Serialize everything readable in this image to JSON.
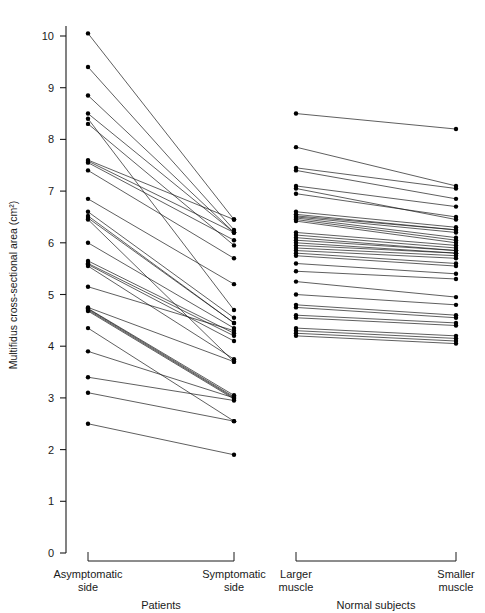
{
  "figure": {
    "background_color": "#ffffff",
    "ink_color": "#1a1a1a"
  },
  "chart_data": {
    "type": "line",
    "subtype": "paired-slope-chart",
    "title": "",
    "subtitle": "",
    "xlabel": "",
    "ylabel": "Multifidus cross-sectional area (cm²)",
    "ylim": [
      0,
      10.5
    ],
    "yticks": [
      0,
      1,
      2,
      3,
      4,
      5,
      6,
      7,
      8,
      9,
      10
    ],
    "ytick_labels": [
      "0",
      "1",
      "2",
      "3",
      "4",
      "5",
      "6",
      "7",
      "8",
      "9",
      "10"
    ],
    "grid": false,
    "legend": "none",
    "x_categories": [
      "Asymptomatic side",
      "Symptomatic side",
      "Larger muscle",
      "Smaller muscle"
    ],
    "groups": [
      {
        "name": "Patients",
        "left_label_line1": "Asymptomatic",
        "left_label_line2": "side",
        "right_label_line1": "Symptomatic",
        "right_label_line2": "side",
        "n": 28,
        "pairs": [
          [
            10.05,
            6.45
          ],
          [
            9.4,
            6.25
          ],
          [
            8.85,
            6.2
          ],
          [
            8.5,
            6.2
          ],
          [
            8.4,
            4.7
          ],
          [
            8.3,
            5.95
          ],
          [
            7.6,
            6.45
          ],
          [
            7.58,
            6.2
          ],
          [
            7.55,
            6.05
          ],
          [
            7.4,
            5.7
          ],
          [
            6.85,
            5.2
          ],
          [
            6.6,
            4.55
          ],
          [
            6.52,
            4.45
          ],
          [
            6.48,
            4.45
          ],
          [
            6.45,
            3.7
          ],
          [
            6.0,
            4.35
          ],
          [
            5.65,
            4.25
          ],
          [
            5.6,
            4.2
          ],
          [
            5.58,
            4.1
          ],
          [
            5.55,
            3.75
          ],
          [
            5.15,
            4.3
          ],
          [
            4.75,
            3.7
          ],
          [
            4.73,
            3.05
          ],
          [
            4.72,
            3.02
          ],
          [
            4.7,
            3.0
          ],
          [
            4.68,
            2.98
          ],
          [
            4.35,
            2.55
          ],
          [
            3.9,
            3.0
          ],
          [
            3.4,
            2.95
          ],
          [
            3.1,
            2.55
          ],
          [
            2.5,
            1.9
          ]
        ]
      },
      {
        "name": "Normal subjects",
        "left_label_line1": "Larger",
        "left_label_line2": "muscle",
        "right_label_line1": "Smaller",
        "right_label_line2": "muscle",
        "n": 34,
        "pairs": [
          [
            8.5,
            8.2
          ],
          [
            7.85,
            7.1
          ],
          [
            7.45,
            7.05
          ],
          [
            7.4,
            6.85
          ],
          [
            7.1,
            6.7
          ],
          [
            7.05,
            6.45
          ],
          [
            6.95,
            6.5
          ],
          [
            6.6,
            6.3
          ],
          [
            6.55,
            6.25
          ],
          [
            6.52,
            6.25
          ],
          [
            6.5,
            6.2
          ],
          [
            6.48,
            6.1
          ],
          [
            6.45,
            6.05
          ],
          [
            6.42,
            6.0
          ],
          [
            6.2,
            5.95
          ],
          [
            6.15,
            5.9
          ],
          [
            6.1,
            5.85
          ],
          [
            6.05,
            5.85
          ],
          [
            6.0,
            5.8
          ],
          [
            5.95,
            5.8
          ],
          [
            5.9,
            5.75
          ],
          [
            5.85,
            5.7
          ],
          [
            5.8,
            5.6
          ],
          [
            5.75,
            5.55
          ],
          [
            5.6,
            5.4
          ],
          [
            5.45,
            5.3
          ],
          [
            5.25,
            4.95
          ],
          [
            5.0,
            4.8
          ],
          [
            4.8,
            4.6
          ],
          [
            4.75,
            4.55
          ],
          [
            4.6,
            4.45
          ],
          [
            4.55,
            4.4
          ],
          [
            4.35,
            4.2
          ],
          [
            4.3,
            4.15
          ],
          [
            4.25,
            4.1
          ],
          [
            4.2,
            4.05
          ]
        ]
      }
    ]
  }
}
